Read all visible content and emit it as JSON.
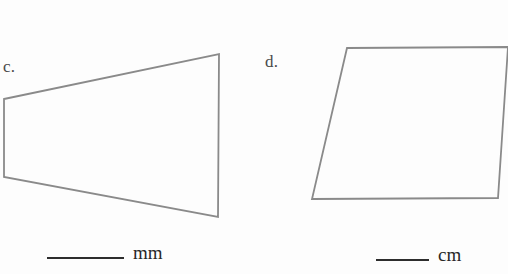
{
  "page": {
    "background_color": "#fdfdfd",
    "stroke_color": "#8a8a8a",
    "text_color": "#2d2d2d"
  },
  "problems": [
    {
      "id": "c",
      "label": "c.",
      "shape": "trapezoid",
      "unit": "mm",
      "answer_value": "",
      "vertices": [
        [
          4,
          99
        ],
        [
          219,
          54
        ],
        [
          218,
          217
        ],
        [
          4,
          177
        ]
      ]
    },
    {
      "id": "d",
      "label": "d.",
      "shape": "parallelogram",
      "unit": "cm",
      "answer_value": "",
      "vertices": [
        [
          347,
          48
        ],
        [
          508,
          47
        ],
        [
          498,
          198
        ],
        [
          312,
          199
        ]
      ]
    }
  ]
}
